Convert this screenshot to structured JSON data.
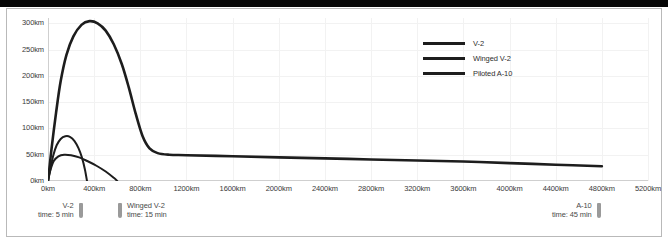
{
  "figure": {
    "background_color": "#ffffff",
    "frame_color": "#b9b9b9",
    "top_bar_color": "#050505"
  },
  "axes": {
    "y_ticks": [
      "0km",
      "50km",
      "100km",
      "150km",
      "200km",
      "250km",
      "300km"
    ],
    "x_ticks": [
      "0km",
      "400km",
      "800km",
      "1200km",
      "1600km",
      "2000km",
      "2400km",
      "2800km",
      "3200km",
      "3600km",
      "4000km",
      "4400km",
      "4800km",
      "5200km"
    ]
  },
  "legend": {
    "items": [
      {
        "label": "V-2",
        "color": "#1d1d1d"
      },
      {
        "label": "Winged V-2",
        "color": "#1d1d1d"
      },
      {
        "label": "Piloted A-10",
        "color": "#1d1d1d"
      }
    ]
  },
  "annotations": [
    {
      "name": "V-2",
      "time": "time: 5 min",
      "marker_color": "#9a9a9a"
    },
    {
      "name": "Winged V-2",
      "time": "time: 15 min",
      "marker_color": "#9a9a9a"
    },
    {
      "name": "A-10",
      "time": "time: 45 min",
      "marker_color": "#9a9a9a"
    }
  ],
  "chart_data": {
    "type": "line",
    "title": "",
    "xlabel": "",
    "ylabel": "",
    "xlim": [
      0,
      5200
    ],
    "ylim": [
      0,
      310
    ],
    "x_unit": "km",
    "y_unit": "km",
    "grid": true,
    "legend_position": "upper-right-inside",
    "x_tick_values": [
      0,
      400,
      800,
      1200,
      1600,
      2000,
      2400,
      2800,
      3200,
      3600,
      4000,
      4400,
      4800,
      5200
    ],
    "y_tick_values": [
      0,
      50,
      100,
      150,
      200,
      250,
      300
    ],
    "series": [
      {
        "name": "V-2",
        "color": "#1d1d1d",
        "points": [
          [
            0,
            0
          ],
          [
            20,
            22
          ],
          [
            45,
            48
          ],
          [
            75,
            68
          ],
          [
            110,
            80
          ],
          [
            150,
            85
          ],
          [
            190,
            84
          ],
          [
            230,
            76
          ],
          [
            265,
            62
          ],
          [
            295,
            44
          ],
          [
            320,
            22
          ],
          [
            338,
            0
          ]
        ]
      },
      {
        "name": "Winged V-2",
        "color": "#1d1d1d",
        "points": [
          [
            0,
            0
          ],
          [
            20,
            20
          ],
          [
            50,
            38
          ],
          [
            90,
            47
          ],
          [
            140,
            50
          ],
          [
            200,
            49
          ],
          [
            270,
            45
          ],
          [
            340,
            38
          ],
          [
            420,
            29
          ],
          [
            500,
            18
          ],
          [
            570,
            6
          ],
          [
            600,
            0
          ]
        ]
      },
      {
        "name": "Piloted A-10",
        "color": "#1d1d1d",
        "points": [
          [
            0,
            0
          ],
          [
            30,
            60
          ],
          [
            70,
            130
          ],
          [
            110,
            190
          ],
          [
            160,
            240
          ],
          [
            220,
            275
          ],
          [
            290,
            297
          ],
          [
            360,
            304
          ],
          [
            430,
            300
          ],
          [
            500,
            286
          ],
          [
            570,
            260
          ],
          [
            640,
            222
          ],
          [
            700,
            178
          ],
          [
            760,
            128
          ],
          [
            820,
            85
          ],
          [
            880,
            62
          ],
          [
            950,
            53
          ],
          [
            1050,
            50
          ],
          [
            1200,
            49
          ],
          [
            1600,
            47
          ],
          [
            2000,
            45
          ],
          [
            2400,
            43
          ],
          [
            2800,
            41
          ],
          [
            3200,
            39
          ],
          [
            3600,
            37
          ],
          [
            4000,
            34
          ],
          [
            4400,
            31
          ],
          [
            4800,
            28
          ]
        ]
      }
    ]
  }
}
